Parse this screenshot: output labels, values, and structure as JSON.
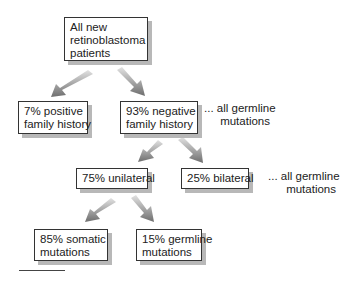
{
  "diagram": {
    "nodes": {
      "root": {
        "lines": [
          "All new",
          "retinoblastoma",
          "patients"
        ]
      },
      "positive": {
        "lines": [
          "7% positive",
          "family history"
        ]
      },
      "negative": {
        "lines": [
          "93% negative",
          "family history"
        ]
      },
      "unilateral": {
        "lines": [
          "75% unilateral"
        ]
      },
      "bilateral": {
        "lines": [
          "25% bilateral"
        ]
      },
      "somatic": {
        "lines": [
          "85% somatic",
          "mutations"
        ]
      },
      "germline": {
        "lines": [
          "15% germline",
          "mutations"
        ]
      }
    },
    "notes": {
      "note1": {
        "lines": [
          "... all germline",
          "mutations"
        ]
      },
      "note2": {
        "lines": [
          "... all germline",
          "mutations"
        ]
      }
    },
    "edges": [
      {
        "from": "root",
        "to": "positive"
      },
      {
        "from": "root",
        "to": "negative"
      },
      {
        "from": "negative",
        "to": "unilateral"
      },
      {
        "from": "negative",
        "to": "bilateral"
      },
      {
        "from": "unilateral",
        "to": "somatic"
      },
      {
        "from": "unilateral",
        "to": "germline"
      }
    ],
    "colors": {
      "arrow": "#7a7a7a",
      "shadow": "#b8b8b8",
      "border": "#333333"
    }
  }
}
